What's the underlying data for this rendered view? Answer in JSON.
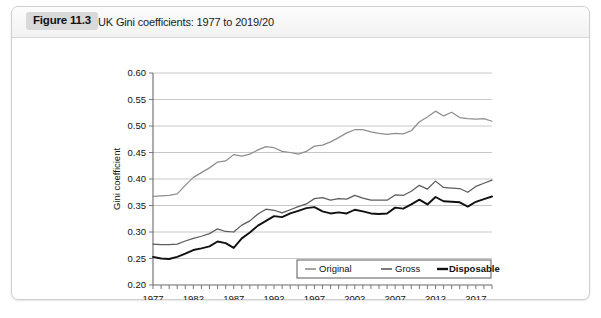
{
  "figure": {
    "badge": "Figure 11.3",
    "caption": "UK Gini coefficients: 1977 to 2019/20"
  },
  "chart_data": {
    "type": "line",
    "title": "UK Gini coefficients: 1977 to 2019/20",
    "xlabel": "",
    "ylabel": "Gini coefficient",
    "ylim": [
      0.2,
      0.6
    ],
    "yticks": [
      "0.20",
      "0.25",
      "0.30",
      "0.35",
      "0.40",
      "0.45",
      "0.50",
      "0.55",
      "0.60"
    ],
    "ytick_values": [
      0.2,
      0.25,
      0.3,
      0.35,
      0.4,
      0.45,
      0.5,
      0.55,
      0.6
    ],
    "xlim": [
      1977,
      2019
    ],
    "xticks": [
      "1977",
      "1982",
      "1987",
      "1992",
      "1997",
      "2002",
      "2007",
      "2012",
      "2017"
    ],
    "xtick_values": [
      1977,
      1982,
      1987,
      1992,
      1997,
      2002,
      2007,
      2012,
      2017
    ],
    "grid": true,
    "legend_position": "bottom-center",
    "x": [
      1977,
      1978,
      1979,
      1980,
      1981,
      1982,
      1983,
      1984,
      1985,
      1986,
      1987,
      1988,
      1989,
      1990,
      1991,
      1992,
      1993,
      1994,
      1995,
      1996,
      1997,
      1998,
      1999,
      2000,
      2001,
      2002,
      2003,
      2004,
      2005,
      2006,
      2007,
      2008,
      2009,
      2010,
      2011,
      2012,
      2013,
      2014,
      2015,
      2016,
      2017,
      2018,
      2019
    ],
    "series": [
      {
        "name": "Original",
        "color": "#8e8e8e",
        "values": [
          0.367,
          0.368,
          0.369,
          0.372,
          0.388,
          0.403,
          0.412,
          0.421,
          0.432,
          0.434,
          0.446,
          0.443,
          0.447,
          0.455,
          0.461,
          0.459,
          0.452,
          0.45,
          0.447,
          0.452,
          0.462,
          0.464,
          0.47,
          0.478,
          0.487,
          0.493,
          0.493,
          0.489,
          0.486,
          0.484,
          0.486,
          0.485,
          0.491,
          0.508,
          0.517,
          0.528,
          0.519,
          0.526,
          0.516,
          0.514,
          0.513,
          0.514,
          0.509
        ]
      },
      {
        "name": "Gross",
        "color": "#5c5c5c",
        "values": [
          0.277,
          0.276,
          0.276,
          0.277,
          0.283,
          0.288,
          0.292,
          0.297,
          0.306,
          0.301,
          0.3,
          0.313,
          0.321,
          0.334,
          0.343,
          0.341,
          0.336,
          0.342,
          0.348,
          0.353,
          0.363,
          0.365,
          0.36,
          0.363,
          0.362,
          0.369,
          0.364,
          0.36,
          0.36,
          0.36,
          0.37,
          0.369,
          0.377,
          0.388,
          0.381,
          0.396,
          0.384,
          0.383,
          0.382,
          0.375,
          0.386,
          0.392,
          0.398
        ]
      },
      {
        "name": "Disposable",
        "color": "#111111",
        "values": [
          0.253,
          0.25,
          0.249,
          0.253,
          0.259,
          0.266,
          0.269,
          0.273,
          0.282,
          0.279,
          0.27,
          0.288,
          0.299,
          0.312,
          0.321,
          0.33,
          0.328,
          0.335,
          0.34,
          0.345,
          0.347,
          0.339,
          0.335,
          0.337,
          0.335,
          0.342,
          0.339,
          0.335,
          0.334,
          0.335,
          0.346,
          0.344,
          0.352,
          0.361,
          0.352,
          0.366,
          0.358,
          0.357,
          0.356,
          0.348,
          0.357,
          0.362,
          0.367
        ]
      }
    ]
  },
  "legend": {
    "items": [
      {
        "label": "Original",
        "color": "#8e8e8e",
        "bold": false
      },
      {
        "label": "Gross",
        "color": "#5c5c5c",
        "bold": false
      },
      {
        "label": "Disposable",
        "color": "#111111",
        "bold": true
      }
    ]
  }
}
